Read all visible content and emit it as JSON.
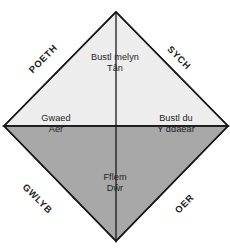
{
  "diagram": {
    "shape": "diamond",
    "quadrants": [
      {
        "id": "top",
        "position": "top",
        "humour": "Bustl melyn",
        "element": "Tân",
        "fill": "#ededed"
      },
      {
        "id": "left",
        "position": "left",
        "humour": "Gwaed",
        "element": "Aer",
        "fill": "#b8b8b8"
      },
      {
        "id": "right",
        "position": "right",
        "humour": "Bustl du",
        "element": "Y ddaear",
        "fill": "#808080"
      },
      {
        "id": "bottom",
        "position": "bottom",
        "humour": "Fflem",
        "element": "Dŵr",
        "fill": "#a8a8a8"
      }
    ],
    "edge_labels": [
      {
        "id": "poeth",
        "text": "POETH",
        "edge": "upper-left"
      },
      {
        "id": "sych",
        "text": "SYCH",
        "edge": "upper-right"
      },
      {
        "id": "gwlyb",
        "text": "GWLYB",
        "edge": "lower-left"
      },
      {
        "id": "oer",
        "text": "OER",
        "edge": "lower-right"
      }
    ],
    "colors": {
      "background": "#ffffff",
      "outline": "#1a1a1a",
      "text": "#232323",
      "edge_label_text": "#1d1d1d"
    }
  }
}
